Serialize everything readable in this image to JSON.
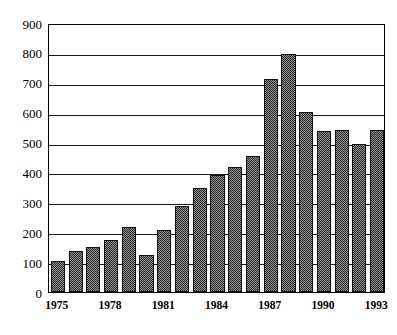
{
  "chart_data": {
    "type": "bar",
    "title": "",
    "subtitle": "",
    "xlabel": "",
    "ylabel": "",
    "categories": [
      "1975",
      "1976",
      "1977",
      "1978",
      "1979",
      "1980",
      "1981",
      "1982",
      "1983",
      "1984",
      "1985",
      "1986",
      "1987",
      "1988",
      "1989",
      "1990",
      "1991",
      "1992",
      "1993"
    ],
    "values": [
      103,
      138,
      152,
      175,
      218,
      125,
      209,
      288,
      348,
      392,
      418,
      455,
      713,
      798,
      601,
      540,
      543,
      496,
      543
    ],
    "series": [
      {
        "name": "",
        "values": [
          103,
          138,
          152,
          175,
          218,
          125,
          209,
          288,
          348,
          392,
          418,
          455,
          713,
          798,
          601,
          540,
          543,
          496,
          543
        ]
      }
    ],
    "ylim": [
      0,
      900
    ],
    "ytick_labels": [
      "0",
      "100",
      "200",
      "300",
      "400",
      "500",
      "600",
      "700",
      "800",
      "900"
    ],
    "ytick_values": [
      0,
      100,
      200,
      300,
      400,
      500,
      600,
      700,
      800,
      900
    ],
    "xtick_labels": [
      "1975",
      "1978",
      "1981",
      "1984",
      "1987",
      "1990",
      "1993"
    ],
    "xtick_categories": [
      "1975",
      "1978",
      "1981",
      "1984",
      "1987",
      "1990",
      "1993"
    ],
    "grid": "horizontal",
    "legend": "none",
    "bar_fill": "#4a4a4a",
    "bar_edge": "#111111",
    "axis_color": "#000000",
    "background": "#ffffff"
  }
}
